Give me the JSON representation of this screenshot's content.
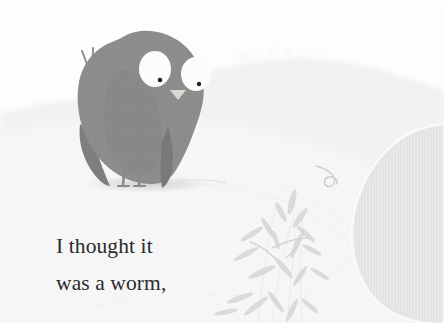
{
  "page": {
    "kind": "illustrated-storybook-page",
    "background_color": "#ffffff",
    "paper_color": "#fdfdfd",
    "width": 444,
    "height": 336
  },
  "caption": {
    "lines": [
      "I thought it",
      "was a worm,"
    ],
    "full_text": "I thought it was a worm,",
    "text_color": "#2b2b2b"
  },
  "illustration": {
    "title": "Small gray bird standing on pale ground beside grass",
    "palette": {
      "paper": "#fdfdfd",
      "ground": "#f4f4f4",
      "hill": "#f1f1f1",
      "bird_body": "#8c8c8c",
      "bird_body_shade": "#7f7f7f",
      "bird_wing": "#828282",
      "eye_white": "#fcfcfc",
      "eye_pupil": "#232323",
      "beak": "#ded9d2",
      "leg": "#8a8a8a",
      "shadow": "#dcdcdc",
      "grass": "#e6e6e6",
      "leaf": "#d7d7d7",
      "stone": "#e2e2e2",
      "tendril": "#cfcfcf"
    },
    "elements": [
      {
        "name": "background-paper",
        "label": "Paper background"
      },
      {
        "name": "hill-mound",
        "label": "Pale mound with grass fringe"
      },
      {
        "name": "ground-plane",
        "label": "Ground plane"
      },
      {
        "name": "stone-boulder",
        "label": "Large rounded stone at right edge"
      },
      {
        "name": "grass-clump",
        "label": "Clump of thin grass leaves"
      },
      {
        "name": "curled-tendril",
        "label": "Small curled tendril"
      },
      {
        "name": "bird",
        "label": "Gray bird character"
      },
      {
        "name": "bird-shadow",
        "label": "Shadow ellipse under bird"
      },
      {
        "name": "bird-eye-left",
        "label": "Left large white eye"
      },
      {
        "name": "bird-eye-right",
        "label": "Right large white eye"
      },
      {
        "name": "bird-beak",
        "label": "Small triangular beak"
      },
      {
        "name": "bird-head-tuft",
        "label": "Three feather spikes on head"
      },
      {
        "name": "bird-leg-left",
        "label": "Left thin leg"
      },
      {
        "name": "bird-leg-right",
        "label": "Right thin leg"
      },
      {
        "name": "bird-tail",
        "label": "Pointed tail"
      },
      {
        "name": "bird-wing",
        "label": "Wing shape on body"
      }
    ]
  }
}
